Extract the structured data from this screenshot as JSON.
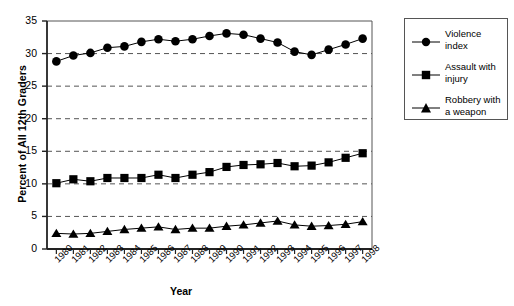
{
  "chart_data": {
    "type": "line",
    "title": "",
    "xlabel": "Year",
    "ylabel": "Percent of All 12th Graders",
    "xlim": [
      1979.3,
      1998.7
    ],
    "ylim": [
      0,
      35
    ],
    "yticks": [
      0,
      5,
      10,
      15,
      20,
      25,
      30,
      35
    ],
    "ytick_labels": [
      "0",
      "5",
      "10",
      "15",
      "20",
      "25",
      "30",
      "35"
    ],
    "grid": "horizontal-dashed",
    "legend_position": "right-outside",
    "categories": [
      1980,
      1981,
      1982,
      1983,
      1984,
      1985,
      1986,
      1987,
      1988,
      1989,
      1990,
      1991,
      1992,
      1993,
      1994,
      1995,
      1996,
      1997,
      1998
    ],
    "xtick_labels": [
      "1980",
      "1981",
      "1982",
      "1983",
      "1984",
      "1985",
      "1986",
      "1987",
      "1988",
      "1989",
      "1990",
      "1991",
      "1992",
      "1993",
      "1994",
      "1995",
      "1996",
      "1997",
      "1998"
    ],
    "series": [
      {
        "name": "Violence index",
        "marker": "circle",
        "color": "#000000",
        "values": [
          28.8,
          29.7,
          30.1,
          30.9,
          31.1,
          31.8,
          32.2,
          31.9,
          32.2,
          32.7,
          33.1,
          32.9,
          32.3,
          31.7,
          30.3,
          29.8,
          30.6,
          31.4,
          32.3
        ]
      },
      {
        "name": "Assault with injury",
        "marker": "square",
        "color": "#000000",
        "values": [
          10.1,
          10.7,
          10.4,
          10.9,
          10.9,
          10.9,
          11.4,
          10.9,
          11.4,
          11.8,
          12.6,
          12.9,
          13.0,
          13.2,
          12.7,
          12.8,
          13.3,
          14.0,
          14.7
        ]
      },
      {
        "name": "Robbery with a weapon",
        "marker": "triangle",
        "color": "#000000",
        "values": [
          2.4,
          2.3,
          2.4,
          2.7,
          3.0,
          3.2,
          3.4,
          3.0,
          3.2,
          3.2,
          3.5,
          3.7,
          4.0,
          4.3,
          3.7,
          3.5,
          3.6,
          3.8,
          4.2
        ]
      }
    ]
  },
  "legend": {
    "entries": [
      {
        "label_line1": "Violence",
        "label_line2": "index",
        "marker": "circle"
      },
      {
        "label_line1": "Assault with",
        "label_line2": "injury",
        "marker": "square"
      },
      {
        "label_line1": "Robbery with",
        "label_line2": "a weapon",
        "marker": "triangle"
      }
    ]
  }
}
